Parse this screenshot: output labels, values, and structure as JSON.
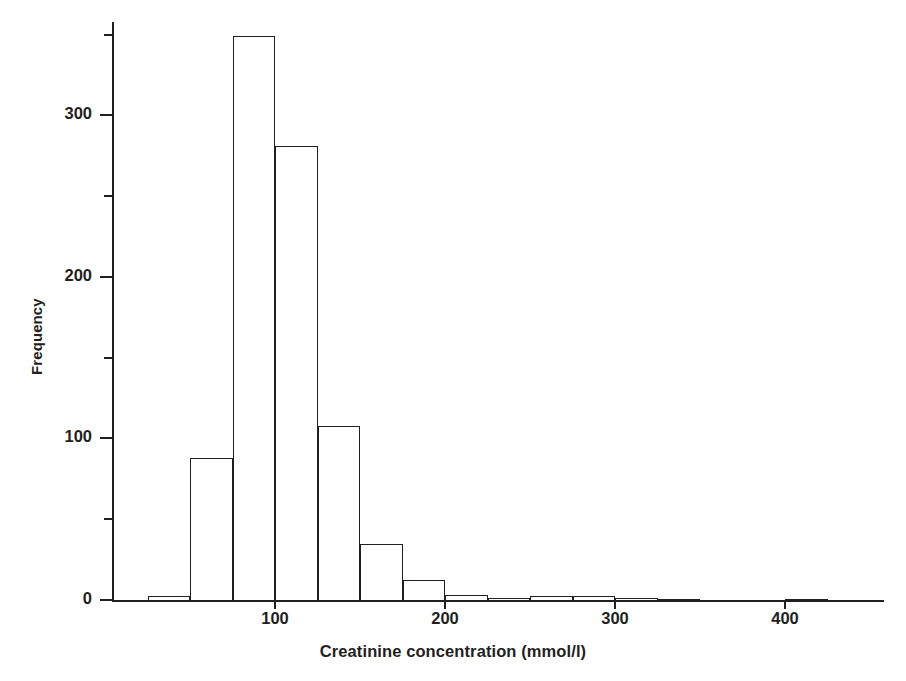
{
  "chart_data": {
    "type": "bar",
    "title": "",
    "subtitle": "",
    "xlabel": "Creatinine concentration (mmol/l)",
    "ylabel": "Frequency",
    "grid": false,
    "legend": false,
    "legend_position": "none",
    "xlim": [
      5,
      455
    ],
    "ylim": [
      0,
      357
    ],
    "bin_width": 25,
    "xticks": [
      100,
      200,
      300,
      400
    ],
    "xtick_labels": [
      "100",
      "200",
      "300",
      "400"
    ],
    "yticks": [
      0,
      100,
      200,
      300
    ],
    "ytick_labels": [
      "0",
      "100",
      "200",
      "300"
    ],
    "yticks_minor": [
      50,
      150,
      250,
      350
    ],
    "bin_edges": [
      5,
      25,
      50,
      75,
      100,
      125,
      150,
      175,
      200,
      225,
      250,
      275,
      300,
      325,
      350,
      375,
      400,
      425,
      450
    ],
    "categories": [
      "5-25",
      "25-50",
      "50-75",
      "75-100",
      "100-125",
      "125-150",
      "150-175",
      "175-200",
      "200-225",
      "225-250",
      "250-275",
      "275-300",
      "300-325",
      "325-350",
      "350-375",
      "375-400",
      "400-425",
      "425-450"
    ],
    "values": [
      0,
      3,
      88,
      348,
      280,
      108,
      35,
      13,
      4,
      2,
      3,
      3,
      2,
      1,
      0,
      0,
      1,
      0
    ],
    "bar_style": "outline",
    "bar_edge_color": "#231f20",
    "bar_fill_color": "transparent",
    "axis_color": "#231f20",
    "background_color": "#ffffff"
  },
  "figure": {
    "axis": {
      "y_label": "Frequency",
      "x_label": "Creatinine concentration (mmol/l)"
    }
  }
}
